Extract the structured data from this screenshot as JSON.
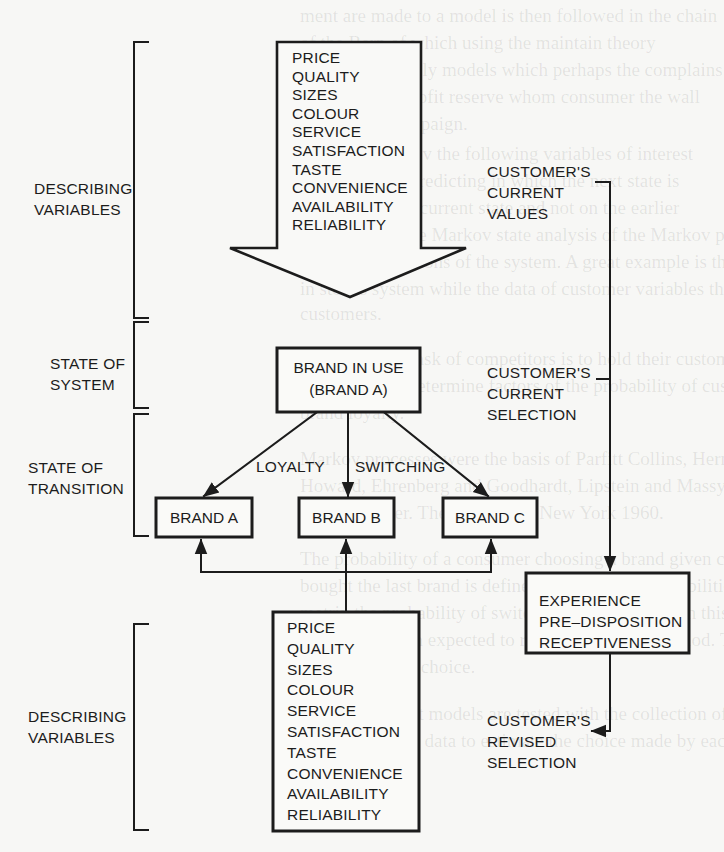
{
  "diagram": {
    "left_labels": {
      "describing_top": [
        "DESCRIBING",
        "VARIABLES"
      ],
      "state_of_system": [
        "STATE OF",
        "SYSTEM"
      ],
      "state_of_transition": [
        "STATE OF",
        "TRANSITION"
      ],
      "describing_bottom": [
        "DESCRIBING",
        "VARIABLES"
      ]
    },
    "top_variables": [
      "PRICE",
      "QUALITY",
      "SIZES",
      "COLOUR",
      "SERVICE",
      "SATISFACTION",
      "TASTE",
      "CONVENIENCE",
      "AVAILABILITY",
      "RELIABILITY"
    ],
    "bottom_variables": [
      "PRICE",
      "QUALITY",
      "SIZES",
      "COLOUR",
      "SERVICE",
      "SATISFACTION",
      "TASTE",
      "CONVENIENCE",
      "AVAILABILITY",
      "RELIABILITY"
    ],
    "brand_in_use": [
      "BRAND IN USE",
      "(BRAND A)"
    ],
    "transition_labels": {
      "loyalty": "LOYALTY",
      "switching": "SWITCHING"
    },
    "brands": [
      "BRAND A",
      "BRAND B",
      "BRAND C"
    ],
    "right_labels": {
      "current_values": [
        "CUSTOMER'S",
        "CURRENT",
        "VALUES"
      ],
      "current_selection": [
        "CUSTOMER'S",
        "CURRENT",
        "SELECTION"
      ],
      "revised_selection": [
        "CUSTOMER'S",
        "REVISED",
        "SELECTION"
      ]
    },
    "experience_box": [
      "EXPERIENCE",
      "PRE–DISPOSITION",
      "RECEPTIVENESS"
    ],
    "colors": {
      "ink": "#1c1c1c",
      "paper": "#f7f7f5"
    }
  }
}
